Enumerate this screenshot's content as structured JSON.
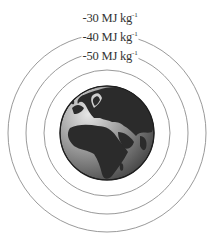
{
  "diagram": {
    "center": {
      "x": 107,
      "y": 133
    },
    "earth": {
      "radius": 47,
      "label": "earth-globe"
    },
    "equipotentials": [
      {
        "value": "-30",
        "unit": "MJ kg",
        "exponent": "-1",
        "radius": 99,
        "label_y": 14
      },
      {
        "value": "-40",
        "unit": "MJ kg",
        "exponent": "-1",
        "radius": 81,
        "label_y": 33
      },
      {
        "value": "-50",
        "unit": "MJ kg",
        "exponent": "-1",
        "radius": 63,
        "label_y": 52
      }
    ],
    "colors": {
      "line": "#9a9a9a",
      "text": "#333333",
      "ocean_light": "#d8d8d8",
      "ocean_dark": "#555555",
      "land": "#2b2b2b"
    }
  }
}
